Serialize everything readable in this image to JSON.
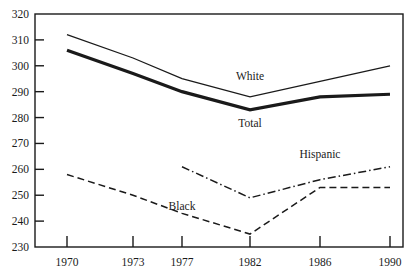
{
  "chart_data": {
    "type": "line",
    "title": "",
    "subtitle": "",
    "xlabel": "",
    "ylabel": "",
    "categories": [
      "1970",
      "1973",
      "1977",
      "1982",
      "1986",
      "1990"
    ],
    "x_tick_labels": [
      "1970",
      "1973",
      "1977",
      "1982",
      "1986",
      "1990"
    ],
    "y_tick_labels": [
      "230",
      "240",
      "250",
      "260",
      "270",
      "280",
      "290",
      "300",
      "310",
      "320"
    ],
    "y_ticks": [
      230,
      240,
      250,
      260,
      270,
      280,
      290,
      300,
      310,
      320
    ],
    "ylim": [
      230,
      320
    ],
    "grid": false,
    "legend_position": "inline-labels",
    "axis_color": "#1a1a1a",
    "series": [
      {
        "name": "White",
        "label": "White",
        "style": "solid-thin",
        "color": "#1a1a1a",
        "x": [
          "1970",
          "1973",
          "1977",
          "1982",
          "1986",
          "1990"
        ],
        "values": [
          312,
          303,
          295,
          288,
          294,
          300
        ],
        "label_x": "1982",
        "label_value": 296
      },
      {
        "name": "Total",
        "label": "Total",
        "style": "solid-thick",
        "color": "#1a1a1a",
        "x": [
          "1970",
          "1973",
          "1977",
          "1982",
          "1986",
          "1990"
        ],
        "values": [
          306,
          297,
          290,
          283,
          288,
          289
        ],
        "label_x": "1982",
        "label_value": 278
      },
      {
        "name": "Black",
        "label": "Black",
        "style": "dashed",
        "color": "#1a1a1a",
        "x": [
          "1970",
          "1973",
          "1977",
          "1982",
          "1986",
          "1990"
        ],
        "values": [
          258,
          250,
          243,
          235,
          253,
          253
        ],
        "label_x": "1977",
        "label_value": 246
      },
      {
        "name": "Hispanic",
        "label": "Hispanic",
        "style": "dash-dot",
        "color": "#1a1a1a",
        "x": [
          "1977",
          "1982",
          "1986",
          "1990"
        ],
        "values": [
          261,
          249,
          256,
          261
        ],
        "label_x": "1986",
        "label_value": 266
      }
    ]
  }
}
